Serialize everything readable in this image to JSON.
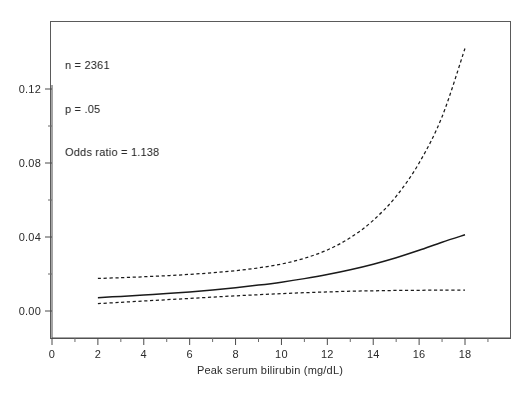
{
  "figure": {
    "background_color": "#ffffff",
    "frame_color": "#5a5a5a",
    "line_color": "#1a1a1a"
  },
  "annotation": {
    "line1": "n = 2361",
    "line2": "p = .05",
    "line3": "Odds ratio = 1.138"
  },
  "chart_data": {
    "type": "line",
    "title": "",
    "subtitle": "",
    "xlabel": "Peak serum bilirubin (mg/dL)",
    "ylabel": "",
    "xlim": [
      0,
      20
    ],
    "ylim": [
      0,
      0.145
    ],
    "grid": false,
    "legend_position": "none",
    "xticks": [
      0,
      2,
      4,
      6,
      8,
      10,
      12,
      14,
      16,
      18
    ],
    "xtick_labels": [
      "0",
      "2",
      "4",
      "6",
      "8",
      "10",
      "12",
      "14",
      "16",
      "18"
    ],
    "x_minor_ticks": [
      1,
      3,
      5,
      7,
      9,
      11,
      13,
      15,
      17,
      19
    ],
    "yticks": [
      0.0,
      0.04,
      0.08,
      0.12
    ],
    "ytick_labels": [
      "0.00",
      "0.04",
      "0.08",
      "0.12"
    ],
    "y_minor_ticks": [
      0.02,
      0.06,
      0.1
    ],
    "annotations": [
      "n = 2361",
      "p = .05",
      "Odds ratio = 1.138"
    ],
    "x": [
      2,
      3,
      4,
      5,
      6,
      7,
      8,
      9,
      10,
      11,
      12,
      13,
      14,
      15,
      16,
      17,
      18
    ],
    "series": [
      {
        "name": "Fitted probability",
        "style": "solid",
        "values": [
          0.0072,
          0.0079,
          0.0086,
          0.0094,
          0.0103,
          0.0114,
          0.0126,
          0.014,
          0.0156,
          0.0175,
          0.0197,
          0.0223,
          0.0253,
          0.0288,
          0.0328,
          0.0372,
          0.0412
        ]
      },
      {
        "name": "Upper 95% confidence limit",
        "style": "dashed",
        "values": [
          0.0176,
          0.018,
          0.0185,
          0.0191,
          0.0198,
          0.0207,
          0.0218,
          0.0233,
          0.0254,
          0.0285,
          0.033,
          0.0396,
          0.049,
          0.062,
          0.08,
          0.105,
          0.142
        ]
      },
      {
        "name": "Lower 95% confidence limit",
        "style": "dashed",
        "values": [
          0.004,
          0.0047,
          0.0054,
          0.0061,
          0.0068,
          0.0075,
          0.0082,
          0.0088,
          0.0094,
          0.0099,
          0.0103,
          0.0107,
          0.0109,
          0.0111,
          0.0112,
          0.0113,
          0.0113
        ]
      }
    ]
  }
}
